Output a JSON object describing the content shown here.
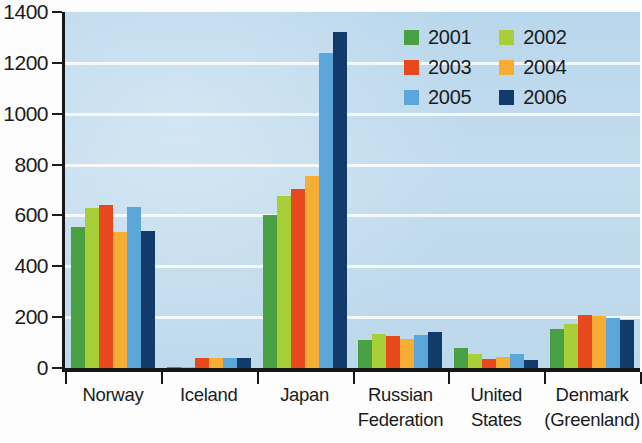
{
  "chart_data": {
    "type": "bar",
    "title": "",
    "xlabel": "",
    "ylabel": "",
    "ylim": [
      0,
      1400
    ],
    "yticks": [
      0,
      200,
      400,
      600,
      800,
      1000,
      1200,
      1400
    ],
    "ytick_labels": [
      "0",
      "200",
      "400",
      "600",
      "800",
      "1000",
      "1200",
      "1400"
    ],
    "grid": true,
    "legend_position": "top-right",
    "categories": [
      "Norway",
      "Iceland",
      "Japan",
      "Russian Federation",
      "United States",
      "Denmark (Greenland)"
    ],
    "category_lines": [
      [
        "Norway"
      ],
      [
        "Iceland"
      ],
      [
        "Japan"
      ],
      [
        "Russian",
        "Federation"
      ],
      [
        "United",
        "States"
      ],
      [
        "Denmark",
        "(Greenland)"
      ]
    ],
    "series": [
      {
        "name": "2001",
        "color": "#49a043",
        "values": [
          555,
          5,
          600,
          110,
          80,
          155
        ]
      },
      {
        "name": "2002",
        "color": "#a9cf38",
        "values": [
          630,
          5,
          675,
          135,
          55,
          175
        ]
      },
      {
        "name": "2003",
        "color": "#e8491c",
        "values": [
          640,
          38,
          705,
          125,
          35,
          210
        ]
      },
      {
        "name": "2004",
        "color": "#f5ad33",
        "values": [
          535,
          38,
          755,
          115,
          45,
          205
        ]
      },
      {
        "name": "2005",
        "color": "#5ba7d9",
        "values": [
          635,
          40,
          1240,
          130,
          55,
          195
        ]
      },
      {
        "name": "2006",
        "color": "#123a6b",
        "values": [
          540,
          38,
          1320,
          140,
          30,
          190
        ]
      }
    ]
  },
  "legend": {
    "entries": [
      {
        "label": "2001",
        "color": "#49a043"
      },
      {
        "label": "2002",
        "color": "#a9cf38"
      },
      {
        "label": "2003",
        "color": "#e8491c"
      },
      {
        "label": "2004",
        "color": "#f5ad33"
      },
      {
        "label": "2005",
        "color": "#5ba7d9"
      },
      {
        "label": "2006",
        "color": "#123a6b"
      }
    ]
  },
  "style": {
    "plot_background": "#bdd9ec",
    "gridline_color": "#ffffff",
    "axis_color": "#16171a",
    "page_background": "#fdfdfd"
  }
}
